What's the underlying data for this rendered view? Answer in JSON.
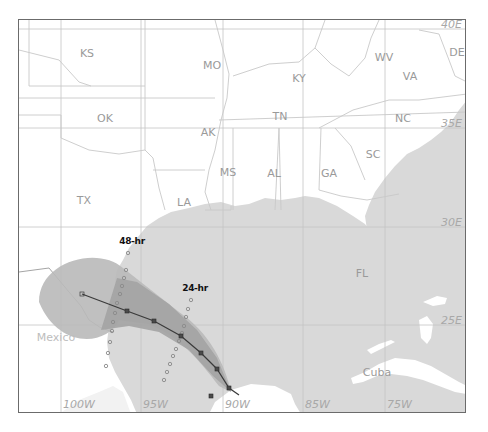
{
  "map": {
    "title": "",
    "colors": {
      "land": "#ffffff",
      "water": "#d9d9d9",
      "state_border": "#c8c8c8",
      "grid": "#c4c4c4",
      "cone_outer": "#b9b9b9",
      "cone_inner": "#a4a4a4",
      "track": "#3a3a3a",
      "frame": "#6b6b6b"
    },
    "states": [
      {
        "label": "KS",
        "x": 68,
        "y": 33
      },
      {
        "label": "MO",
        "x": 193,
        "y": 45
      },
      {
        "label": "KY",
        "x": 280,
        "y": 58
      },
      {
        "label": "WV",
        "x": 365,
        "y": 37
      },
      {
        "label": "VA",
        "x": 391,
        "y": 56
      },
      {
        "label": "OK",
        "x": 86,
        "y": 98
      },
      {
        "label": "AK",
        "x": 189,
        "y": 112
      },
      {
        "label": "TN",
        "x": 261,
        "y": 96
      },
      {
        "label": "NC",
        "x": 384,
        "y": 98
      },
      {
        "label": "MS",
        "x": 209,
        "y": 152
      },
      {
        "label": "AL",
        "x": 255,
        "y": 153
      },
      {
        "label": "GA",
        "x": 310,
        "y": 153
      },
      {
        "label": "SC",
        "x": 354,
        "y": 134
      },
      {
        "label": "DE",
        "x": 438,
        "y": 32
      },
      {
        "label": "TX",
        "x": 65,
        "y": 180
      },
      {
        "label": "LA",
        "x": 165,
        "y": 182
      },
      {
        "label": "FL",
        "x": 343,
        "y": 253
      },
      {
        "label": "Mexico",
        "x": 37,
        "y": 317
      },
      {
        "label": "Cuba",
        "x": 358,
        "y": 352
      }
    ],
    "longitude_labels": [
      {
        "label": "100W",
        "x": 62
      },
      {
        "label": "95W",
        "x": 142
      },
      {
        "label": "90W",
        "x": 224
      },
      {
        "label": "85W",
        "x": 304
      },
      {
        "label": "75W",
        "x": 386
      }
    ],
    "latitude_labels": [
      {
        "label": "40E",
        "y": 10
      },
      {
        "label": "35E",
        "y": 109
      },
      {
        "label": "30E",
        "y": 208
      },
      {
        "label": "25E",
        "y": 306
      }
    ],
    "forecast_labels": {
      "h48": "48-hr",
      "h24": "24-hr"
    },
    "track": {
      "points": [
        [
          63,
          274
        ],
        [
          108,
          291
        ],
        [
          135,
          301
        ],
        [
          162,
          316
        ],
        [
          182,
          333
        ],
        [
          198,
          349
        ],
        [
          210,
          368
        ],
        [
          220,
          375
        ]
      ]
    },
    "wind_swath_48": [
      [
        109,
        233
      ],
      [
        107,
        250
      ],
      [
        105,
        258
      ],
      [
        103,
        266
      ],
      [
        101,
        274
      ],
      [
        98,
        283
      ],
      [
        96,
        293
      ],
      [
        94,
        302
      ],
      [
        93,
        311
      ],
      [
        91,
        322
      ],
      [
        89,
        333
      ],
      [
        87,
        346
      ]
    ],
    "wind_swath_24": [
      [
        172,
        280
      ],
      [
        169,
        289
      ],
      [
        167,
        297
      ],
      [
        165,
        306
      ],
      [
        163,
        313
      ],
      [
        160,
        321
      ],
      [
        157,
        329
      ],
      [
        154,
        336
      ],
      [
        151,
        344
      ],
      [
        148,
        352
      ],
      [
        145,
        360
      ]
    ]
  }
}
